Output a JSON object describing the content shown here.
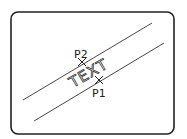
{
  "diagram": {
    "frame": {
      "x": 11,
      "y": 12,
      "width": 163,
      "height": 122,
      "radius": 7,
      "stroke": "#222222"
    },
    "lines": [
      {
        "name": "upper-line",
        "x1": 23,
        "y1": 100,
        "x2": 152,
        "y2": 23
      },
      {
        "name": "lower-line",
        "x1": 34,
        "y1": 121,
        "x2": 164,
        "y2": 43
      }
    ],
    "points": [
      {
        "id": "P1",
        "label": "P1",
        "x": 99,
        "y": 80
      },
      {
        "id": "P2",
        "label": "P2",
        "x": 82,
        "y": 62
      }
    ],
    "text_label": "TEXT",
    "text_angle": -30
  }
}
